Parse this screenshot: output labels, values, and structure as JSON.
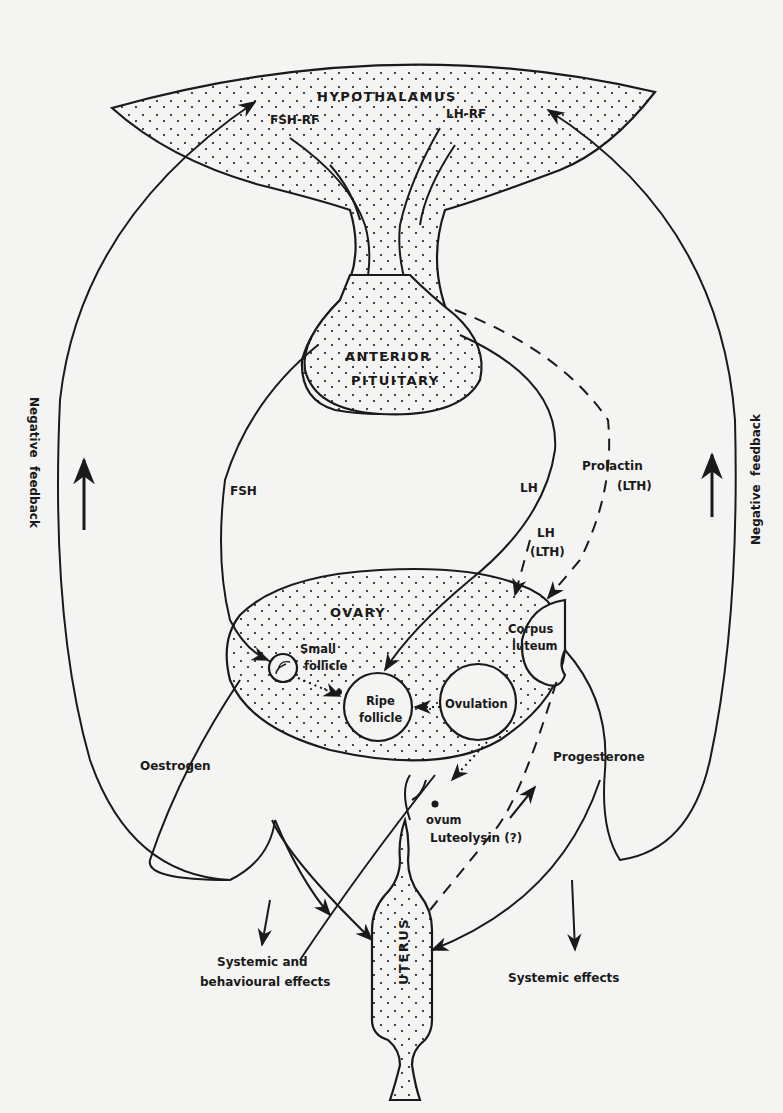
{
  "diagram": {
    "organs": {
      "hypothalamus": "HYPOTHALAMUS",
      "anterior_pituitary_line1": "ANTERIOR",
      "anterior_pituitary_line2": "PITUITARY",
      "ovary": "OVARY",
      "uterus": "UTERUS"
    },
    "releasing_factors": {
      "fsh_rf": "FSH-RF",
      "lh_rf": "LH-RF"
    },
    "hormones": {
      "fsh": "FSH",
      "lh": "LH",
      "lh_lth_line1": "LH",
      "lh_lth_line2": "(LTH)",
      "prolactin_line1": "Prolactin",
      "prolactin_line2": "(LTH)",
      "oestrogen": "Oestrogen",
      "progesterone": "Progesterone",
      "luteolysin": "Luteolysin (?)"
    },
    "ovary_stages": {
      "small_follicle_line1": "Small",
      "small_follicle_line2": "follicle",
      "ripe_follicle_line1": "Ripe",
      "ripe_follicle_line2": "follicle",
      "ovulation": "Ovulation",
      "corpus_luteum_line1": "Corpus",
      "corpus_luteum_line2": "luteum",
      "ovum": "ovum"
    },
    "effects": {
      "systemic_behavioural_line1": "Systemic and",
      "systemic_behavioural_line2": "behavioural effects",
      "systemic": "Systemic effects"
    },
    "feedback": {
      "left": "Negative  feedback",
      "right": "Negative  feedback"
    },
    "colors": {
      "ink": "#1a1a1a",
      "paper": "#f4f4f2"
    }
  }
}
